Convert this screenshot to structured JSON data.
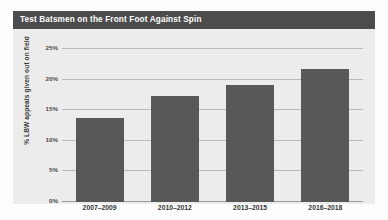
{
  "panel": {
    "title": "Test Batsmen on the Front Foot Against Spin",
    "title_bar_color": "#4c4c4c",
    "title_text_color": "#ffffff",
    "panel_background": "#ececec",
    "page_background": "#fdfdfd"
  },
  "chart_data": {
    "type": "bar",
    "title": "Test Batsmen on the Front Foot Against Spin",
    "xlabel": "",
    "ylabel": "% LBW appeals given out on field",
    "categories": [
      "2007–2009",
      "2010–2012",
      "2013–2015",
      "2016–2018"
    ],
    "values": [
      13.8,
      17.4,
      19.2,
      21.7
    ],
    "series": [
      {
        "name": "% LBW appeals given out on field",
        "values": [
          13.8,
          17.4,
          19.2,
          21.7
        ],
        "color": "#585858"
      }
    ],
    "ylim": [
      0,
      25
    ],
    "ytick_values": [
      0,
      5,
      10,
      15,
      20,
      25
    ],
    "ytick_labels": [
      "0%",
      "5%",
      "10%",
      "15%",
      "20%",
      "25%"
    ],
    "grid": true,
    "grid_axis": "y",
    "grid_color": "#b9b9b9",
    "legend": false,
    "legend_position": "none",
    "bar_color": "#585858",
    "axis_color": "#9a9a9a"
  }
}
